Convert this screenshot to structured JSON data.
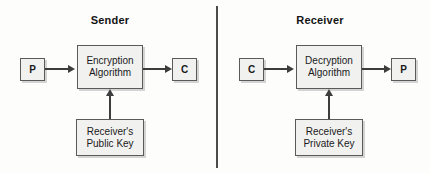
{
  "diagram": {
    "divider_color": "#4b4b4b",
    "box_fill": "#f1f1f0",
    "box_border": "#5a5a5a",
    "line_color": "#3d3d3d"
  },
  "sender": {
    "title": "Sender",
    "plaintext_label": "P",
    "algorithm_line1": "Encryption",
    "algorithm_line2": "Algorithm",
    "ciphertext_label": "C",
    "key_line1": "Receiver's",
    "key_line2": "Public Key"
  },
  "receiver": {
    "title": "Receiver",
    "ciphertext_label": "C",
    "algorithm_line1": "Decryption",
    "algorithm_line2": "Algorithm",
    "plaintext_label": "P",
    "key_line1": "Receiver's",
    "key_line2": "Private Key"
  }
}
